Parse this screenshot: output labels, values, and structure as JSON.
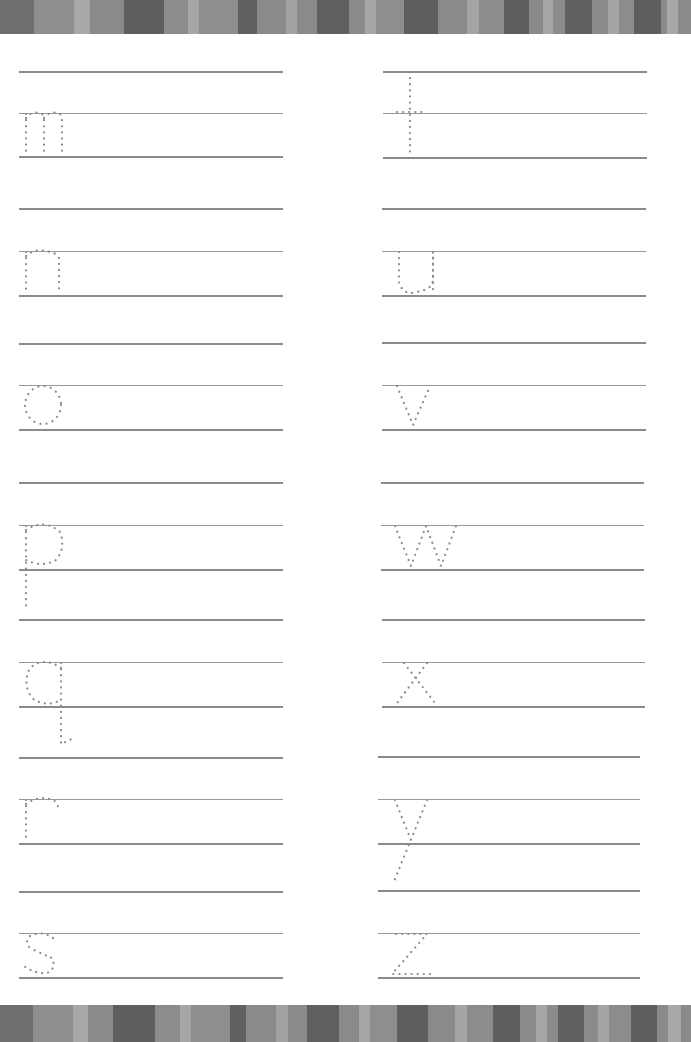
{
  "worksheet": {
    "type": "lowercase-letter-tracing",
    "left_column_letters": [
      "m",
      "n",
      "o",
      "p",
      "q",
      "r",
      "s"
    ],
    "right_column_letters": [
      "t",
      "u",
      "v",
      "w",
      "x",
      "y",
      "z"
    ]
  },
  "colors": {
    "line": "#8a8a8a",
    "guide_line": "#9a9a9a",
    "dot": "#8c8c8c",
    "background": "#ffffff"
  },
  "top_stripes": [
    {
      "w": 28,
      "c": "#6e6e6e"
    },
    {
      "w": 32,
      "c": "#8e8e8e"
    },
    {
      "w": 13,
      "c": "#a8a8a8"
    },
    {
      "w": 28,
      "c": "#8a8a8a"
    },
    {
      "w": 32,
      "c": "#5e5e5e"
    },
    {
      "w": 20,
      "c": "#8c8c8c"
    },
    {
      "w": 9,
      "c": "#a6a6a6"
    },
    {
      "w": 32,
      "c": "#8e8e8e"
    },
    {
      "w": 15,
      "c": "#606060"
    },
    {
      "w": 24,
      "c": "#8a8a8a"
    },
    {
      "w": 9,
      "c": "#a2a2a2"
    },
    {
      "w": 16,
      "c": "#8a8a8a"
    },
    {
      "w": 26,
      "c": "#606060"
    },
    {
      "w": 13,
      "c": "#8a8a8a"
    },
    {
      "w": 9,
      "c": "#a6a6a6"
    },
    {
      "w": 23,
      "c": "#8e8e8e"
    },
    {
      "w": 27,
      "c": "#5e5e5e"
    },
    {
      "w": 24,
      "c": "#8a8a8a"
    },
    {
      "w": 10,
      "c": "#a4a4a4"
    },
    {
      "w": 20,
      "c": "#8c8c8c"
    },
    {
      "w": 20,
      "c": "#5e5e5e"
    },
    {
      "w": 12,
      "c": "#8a8a8a"
    },
    {
      "w": 8,
      "c": "#a6a6a6"
    },
    {
      "w": 10,
      "c": "#8c8c8c"
    },
    {
      "w": 22,
      "c": "#606060"
    },
    {
      "w": 13,
      "c": "#8a8a8a"
    },
    {
      "w": 9,
      "c": "#a4a4a4"
    },
    {
      "w": 12,
      "c": "#8c8c8c"
    },
    {
      "w": 22,
      "c": "#5e5e5e"
    },
    {
      "w": 5,
      "c": "#8a8a8a"
    },
    {
      "w": 9,
      "c": "#a8a8a8"
    },
    {
      "w": 10,
      "c": "#8a8a8a"
    }
  ],
  "bottom_stripes": [
    {
      "w": 33,
      "c": "#6e6e6e"
    },
    {
      "w": 40,
      "c": "#8e8e8e"
    },
    {
      "w": 16,
      "c": "#a8a8a8"
    },
    {
      "w": 25,
      "c": "#8a8a8a"
    },
    {
      "w": 42,
      "c": "#5e5e5e"
    },
    {
      "w": 25,
      "c": "#8c8c8c"
    },
    {
      "w": 11,
      "c": "#a6a6a6"
    },
    {
      "w": 39,
      "c": "#8e8e8e"
    },
    {
      "w": 17,
      "c": "#606060"
    },
    {
      "w": 30,
      "c": "#8a8a8a"
    },
    {
      "w": 12,
      "c": "#a2a2a2"
    },
    {
      "w": 19,
      "c": "#8a8a8a"
    },
    {
      "w": 32,
      "c": "#606060"
    },
    {
      "w": 20,
      "c": "#8a8a8a"
    },
    {
      "w": 11,
      "c": "#a6a6a6"
    },
    {
      "w": 27,
      "c": "#8e8e8e"
    },
    {
      "w": 32,
      "c": "#5e5e5e"
    },
    {
      "w": 27,
      "c": "#8a8a8a"
    },
    {
      "w": 12,
      "c": "#a4a4a4"
    },
    {
      "w": 26,
      "c": "#8c8c8c"
    },
    {
      "w": 27,
      "c": "#5e5e5e"
    },
    {
      "w": 16,
      "c": "#8a8a8a"
    },
    {
      "w": 11,
      "c": "#a6a6a6"
    },
    {
      "w": 11,
      "c": "#8c8c8c"
    },
    {
      "w": 27,
      "c": "#606060"
    },
    {
      "w": 14,
      "c": "#8a8a8a"
    },
    {
      "w": 11,
      "c": "#a4a4a4"
    },
    {
      "w": 22,
      "c": "#8c8c8c"
    },
    {
      "w": 26,
      "c": "#5e5e5e"
    },
    {
      "w": 11,
      "c": "#8a8a8a"
    },
    {
      "w": 13,
      "c": "#a8a8a8"
    },
    {
      "w": 10,
      "c": "#8a8a8a"
    }
  ]
}
